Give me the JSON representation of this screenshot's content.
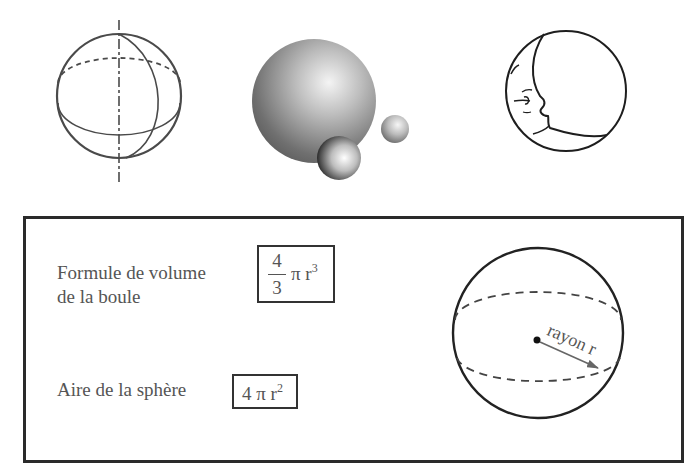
{
  "illustrations": {
    "wireframe_sphere": {
      "name": "wireframe-sphere-with-axis"
    },
    "shaded_spheres": {
      "name": "shaded-3d-spheres",
      "count": 3
    },
    "moon_face": {
      "name": "moon-face-drawing"
    }
  },
  "formula_box": {
    "volume": {
      "label_line1": "Formule de volume",
      "label_line2": "de la boule",
      "numerator": "4",
      "denominator": "3",
      "pi_r": "π r",
      "exponent": "3"
    },
    "area": {
      "label": "Aire de la sphère",
      "expression": "4 π r",
      "exponent": "2"
    },
    "diagram": {
      "radius_label": "rayon r"
    }
  },
  "colors": {
    "line": "#2a2a2a",
    "text": "#555555",
    "sphere_dark": "#5a5a5a",
    "sphere_light": "#f2f2f2"
  }
}
